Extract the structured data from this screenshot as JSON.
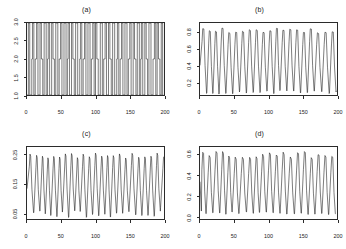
{
  "figure": {
    "width": 346,
    "height": 249,
    "background": "#ffffff",
    "line_color": "#101010",
    "axis_color": "#2b2b2b",
    "layout": "2x2 grid of time-series panels"
  },
  "chart_data": [
    {
      "type": "line",
      "panel": "a",
      "title": "(a)",
      "xlabel": "",
      "ylabel": "",
      "xlim": [
        0,
        200
      ],
      "ylim": [
        1.0,
        3.0
      ],
      "xticks": [
        0,
        50,
        100,
        150,
        200
      ],
      "yticks": [
        1.0,
        1.5,
        2.0,
        2.5,
        3.0
      ],
      "xticklabels": [
        "0",
        "50",
        "100",
        "150",
        "200"
      ],
      "yticklabels": [
        "1.0",
        "1.5",
        "2.0",
        "2.5",
        "3.0"
      ],
      "grid": false,
      "legend": null,
      "description": "Square-wave / step-like switching signal alternating between low plateau near 1.0 and high plateau near 3.0, with intermediate dwell levels around 2.0",
      "x": [
        0,
        1,
        2,
        3,
        4,
        5,
        6,
        7,
        8,
        9,
        10,
        11,
        12,
        13,
        14,
        15,
        16,
        17,
        18,
        19,
        20,
        21,
        22,
        23,
        24,
        25,
        26,
        27,
        28,
        29,
        30,
        31,
        32,
        33,
        34,
        35,
        36,
        37,
        38,
        39,
        40,
        41,
        42,
        43,
        44,
        45,
        46,
        47,
        48,
        49,
        50,
        51,
        52,
        53,
        54,
        55,
        56,
        57,
        58,
        59,
        60,
        61,
        62,
        63,
        64,
        65,
        66,
        67,
        68,
        69,
        70,
        71,
        72,
        73,
        74,
        75,
        76,
        77,
        78,
        79,
        80,
        81,
        82,
        83,
        84,
        85,
        86,
        87,
        88,
        89,
        90,
        91,
        92,
        93,
        94,
        95,
        96,
        97,
        98,
        99,
        100,
        101,
        102,
        103,
        104,
        105,
        106,
        107,
        108,
        109,
        110,
        111,
        112,
        113,
        114,
        115,
        116,
        117,
        118,
        119,
        120,
        121,
        122,
        123,
        124,
        125,
        126,
        127,
        128,
        129,
        130,
        131,
        132,
        133,
        134,
        135,
        136,
        137,
        138,
        139,
        140,
        141,
        142,
        143,
        144,
        145,
        146,
        147,
        148,
        149,
        150,
        151,
        152,
        153,
        154,
        155,
        156,
        157,
        158,
        159,
        160,
        161,
        162,
        163,
        164,
        165,
        166,
        167,
        168,
        169,
        170,
        171,
        172,
        173,
        174,
        175,
        176,
        177,
        178,
        179,
        180,
        181,
        182,
        183,
        184,
        185,
        186,
        187,
        188,
        189,
        190,
        191,
        192,
        193,
        194,
        195,
        196,
        197,
        198,
        199,
        200
      ],
      "y": [
        1.0,
        1.0,
        3.0,
        3.0,
        1.0,
        1.0,
        1.0,
        2.0,
        3.0,
        3.0,
        1.0,
        1.0,
        2.0,
        2.0,
        3.0,
        3.0,
        1.0,
        1.0,
        1.0,
        3.0,
        3.0,
        2.0,
        2.0,
        1.0,
        1.0,
        3.0,
        3.0,
        3.0,
        1.0,
        1.0,
        2.0,
        3.0,
        3.0,
        1.0,
        1.0,
        1.0,
        3.0,
        3.0,
        2.0,
        2.0,
        1.0,
        1.0,
        3.0,
        3.0,
        3.0,
        1.0,
        1.0,
        2.0,
        2.0,
        3.0,
        3.0,
        1.0,
        1.0,
        1.0,
        3.0,
        3.0,
        3.0,
        1.0,
        1.0,
        2.0,
        3.0,
        3.0,
        1.0,
        1.0,
        1.0,
        3.0,
        3.0,
        2.0,
        2.0,
        1.0,
        1.0,
        3.0,
        3.0,
        3.0,
        1.0,
        1.0,
        1.0,
        2.0,
        3.0,
        3.0,
        1.0,
        1.0,
        2.0,
        2.0,
        3.0,
        3.0,
        1.0,
        1.0,
        1.0,
        3.0,
        3.0,
        3.0,
        1.0,
        1.0,
        2.0,
        2.0,
        3.0,
        3.0,
        1.0,
        1.0,
        3.0,
        3.0,
        2.0,
        2.0,
        1.0,
        1.0,
        1.0,
        3.0,
        3.0,
        3.0,
        1.0,
        1.0,
        2.0,
        2.0,
        3.0,
        3.0,
        1.0,
        1.0,
        1.0,
        3.0,
        3.0,
        2.0,
        2.0,
        1.0,
        1.0,
        3.0,
        3.0,
        3.0,
        1.0,
        1.0,
        1.0,
        2.0,
        3.0,
        3.0,
        1.0,
        1.0,
        2.0,
        2.0,
        3.0,
        3.0,
        1.0,
        1.0,
        1.0,
        3.0,
        3.0,
        3.0,
        1.0,
        1.0,
        2.0,
        2.0,
        3.0,
        3.0,
        1.0,
        1.0,
        1.0,
        3.0,
        3.0,
        2.0,
        2.0,
        1.0,
        1.0,
        3.0,
        3.0,
        3.0,
        1.0,
        1.0,
        2.0,
        3.0,
        3.0,
        1.0,
        1.0,
        1.0,
        3.0,
        3.0,
        2.0,
        2.0,
        1.0,
        1.0,
        3.0,
        3.0,
        3.0,
        1.0,
        1.0,
        1.0,
        2.0,
        2.0,
        3.0,
        3.0,
        1.0,
        1.0,
        3.0,
        3.0,
        2.0,
        2.0,
        1.0,
        1.0,
        3.0,
        3.0,
        1.0
      ]
    },
    {
      "type": "line",
      "panel": "b",
      "title": "(b)",
      "xlabel": "",
      "ylabel": "",
      "xlim": [
        0,
        200
      ],
      "ylim": [
        0.05,
        0.92
      ],
      "xticks": [
        0,
        50,
        100,
        150,
        200
      ],
      "yticks": [
        0.2,
        0.4,
        0.6,
        0.8
      ],
      "xticklabels": [
        "0",
        "50",
        "100",
        "150",
        "200"
      ],
      "yticklabels": [
        "0.2",
        "0.4",
        "0.6",
        "0.8"
      ],
      "grid": false,
      "legend": null,
      "description": "Sharp periodic oscillation, roughly period 10, rising steeply to flat-topped maxima near 0.86 and dropping to sharp minima near 0.08",
      "period": 10,
      "ymax_typical": 0.86,
      "ymin_typical": 0.08
    },
    {
      "type": "line",
      "panel": "c",
      "title": "(c)",
      "xlabel": "",
      "ylabel": "",
      "xlim": [
        0,
        200
      ],
      "ylim": [
        0.03,
        0.28
      ],
      "xticks": [
        0,
        50,
        100,
        150,
        200
      ],
      "yticks": [
        0.05,
        0.15,
        0.25
      ],
      "xticklabels": [
        "0",
        "50",
        "100",
        "150",
        "200"
      ],
      "yticklabels": [
        "0.05",
        "0.15",
        "0.25"
      ],
      "grid": false,
      "legend": null,
      "description": "Spiky periodic oscillation with narrow tall peaks near 0.26 and sharp troughs near 0.045, period about 9",
      "period": 9,
      "ymax_typical": 0.26,
      "ymin_typical": 0.045
    },
    {
      "type": "line",
      "panel": "d",
      "title": "(d)",
      "xlabel": "",
      "ylabel": "",
      "xlim": [
        0,
        200
      ],
      "ylim": [
        -0.02,
        0.68
      ],
      "xticks": [
        0,
        50,
        100,
        150,
        200
      ],
      "yticks": [
        0.0,
        0.2,
        0.4,
        0.6
      ],
      "xticklabels": [
        "0",
        "50",
        "100",
        "150",
        "200"
      ],
      "yticklabels": [
        "0.0",
        "0.2",
        "0.4",
        "0.6"
      ],
      "grid": false,
      "legend": null,
      "description": "Periodic oscillation with rounded peaks near 0.64 and deep narrow troughs near 0.02, period about 10",
      "period": 10,
      "ymax_typical": 0.64,
      "ymin_typical": 0.02
    }
  ]
}
